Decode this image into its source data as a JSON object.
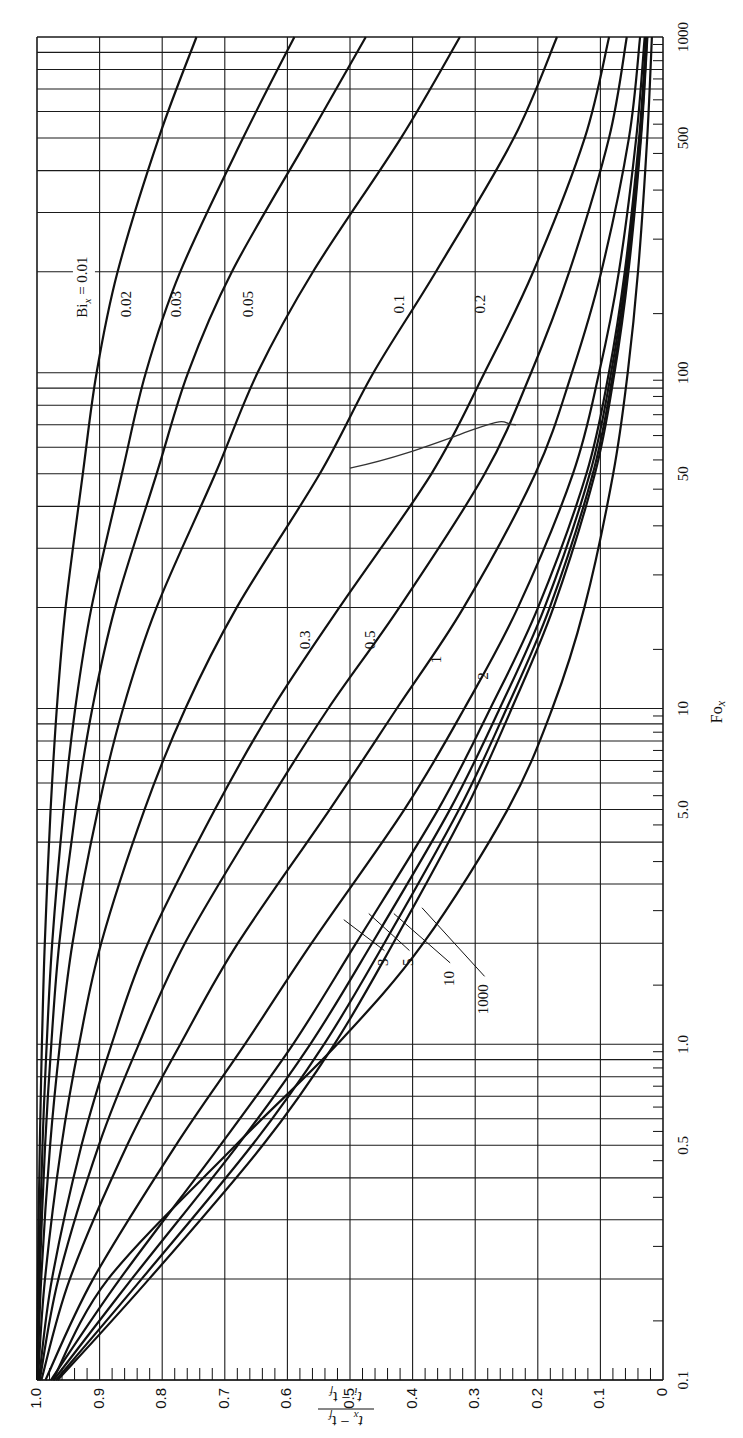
{
  "chart_data": {
    "type": "line",
    "title": "",
    "orientation_note": "figure rotated 90 degrees counter-clockwise",
    "xlabel": "Fo_x",
    "ylabel": "(t_x - t_f) / (t_i - t_f)",
    "x_scale": "log",
    "xlim": [
      0.1,
      1000
    ],
    "ylim": [
      0,
      1.0
    ],
    "grid": true,
    "x_tick_labels": [
      "0.1",
      "0.5",
      "1.0",
      "5.0",
      "10",
      "50",
      "100",
      "500",
      "1000"
    ],
    "y_tick_labels": [
      "0",
      "0.1",
      "0.2",
      "0.3",
      "0.4",
      "0.5",
      "0.6",
      "0.7",
      "0.8",
      "0.9",
      "1.0"
    ],
    "x": [
      0.1,
      0.2,
      0.5,
      1,
      2,
      5,
      10,
      20,
      50,
      100,
      200,
      500,
      1000
    ],
    "series": [
      {
        "name": "Bi_x = 0.01",
        "label": "Bi_x = 0.01",
        "values": [
          0.9999,
          0.9986,
          0.9955,
          0.9921,
          0.9876,
          0.9782,
          0.9683,
          0.9543,
          0.9268,
          0.9048,
          0.8712,
          0.8056,
          0.7452
        ]
      },
      {
        "name": "0.02",
        "label": "0.02",
        "values": [
          0.9997,
          0.9972,
          0.9912,
          0.9845,
          0.9757,
          0.9575,
          0.9389,
          0.9129,
          0.8643,
          0.8262,
          0.7711,
          0.6709,
          0.5888
        ]
      },
      {
        "name": "0.03",
        "label": "0.03",
        "values": [
          0.9995,
          0.9959,
          0.987,
          0.9772,
          0.9644,
          0.9381,
          0.9116,
          0.8752,
          0.8089,
          0.7588,
          0.6887,
          0.5667,
          0.4747
        ]
      },
      {
        "name": "0.05",
        "label": "0.05",
        "values": [
          0.9992,
          0.9933,
          0.979,
          0.9634,
          0.9433,
          0.9026,
          0.8625,
          0.809,
          0.7152,
          0.6477,
          0.5591,
          0.4187,
          0.3244
        ]
      },
      {
        "name": "0.1",
        "label": "0.1",
        "values": [
          0.9985,
          0.9873,
          0.9609,
          0.9327,
          0.8975,
          0.8282,
          0.763,
          0.6808,
          0.5482,
          0.4626,
          0.3628,
          0.2383,
          0.1694
        ]
      },
      {
        "name": "0.2",
        "label": "0.2",
        "values": [
          0.997,
          0.9761,
          0.9289,
          0.8808,
          0.8229,
          0.7158,
          0.624,
          0.5169,
          0.37,
          0.2851,
          0.2073,
          0.1251,
          0.0861
        ]
      },
      {
        "name": "0.3",
        "label": "0.3",
        "values": [
          0.9956,
          0.9658,
          0.9013,
          0.8374,
          0.7638,
          0.6371,
          0.5346,
          0.4211,
          0.2848,
          0.2107,
          0.1497,
          0.0863,
          0.0578
        ]
      },
      {
        "name": "0.5",
        "label": "0.5",
        "values": [
          0.9929,
          0.9474,
          0.856,
          0.7711,
          0.679,
          0.5324,
          0.4252,
          0.3184,
          0.204,
          0.1456,
          0.0986,
          0.0545,
          0.0366
        ]
      },
      {
        "name": "1",
        "label": "1",
        "values": [
          0.9865,
          0.9102,
          0.7782,
          0.668,
          0.5614,
          0.4132,
          0.3174,
          0.2317,
          0.1439,
          0.102,
          0.0704,
          0.0428,
          0.0293
        ]
      },
      {
        "name": "2",
        "label": "2",
        "values": [
          0.9776,
          0.8674,
          0.7073,
          0.5911,
          0.4903,
          0.3593,
          0.2758,
          0.1995,
          0.1223,
          0.0864,
          0.0611,
          0.0382,
          0.0268
        ]
      },
      {
        "name": "3",
        "label": "3",
        "values": [
          0.9734,
          0.8485,
          0.6794,
          0.5636,
          0.4647,
          0.3404,
          0.2608,
          0.1891,
          0.1169,
          0.0829,
          0.0588,
          0.037,
          0.0262
        ]
      },
      {
        "name": "5",
        "label": "5",
        "values": [
          0.9696,
          0.8327,
          0.6566,
          0.5415,
          0.4452,
          0.3259,
          0.2498,
          0.1809,
          0.1122,
          0.0797,
          0.0567,
          0.0359,
          0.0255
        ]
      },
      {
        "name": "10",
        "label": "10",
        "values": [
          0.9667,
          0.8207,
          0.6395,
          0.525,
          0.431,
          0.3154,
          0.2417,
          0.175,
          0.1088,
          0.0775,
          0.0552,
          0.0351,
          0.025
        ]
      },
      {
        "name": "1000",
        "label": "1000",
        "values": [
          0.9747,
          0.8862,
          0.6827,
          0.5205,
          0.3829,
          0.2482,
          0.1769,
          0.1255,
          0.0796,
          0.0564,
          0.0399,
          0.0252,
          0.0178
        ]
      }
    ],
    "label_positions": [
      {
        "text": "Bi_x = 0.01",
        "fo": 180,
        "theta": 0.925
      },
      {
        "text": "0.02",
        "fo": 160,
        "theta": 0.855
      },
      {
        "text": "0.03",
        "fo": 160,
        "theta": 0.775
      },
      {
        "text": "0.05",
        "fo": 160,
        "theta": 0.66
      },
      {
        "text": "0.1",
        "fo": 160,
        "theta": 0.42
      },
      {
        "text": "0.2",
        "fo": 160,
        "theta": 0.29
      },
      {
        "text": "0.3",
        "fo": 16,
        "theta": 0.57
      },
      {
        "text": "0.5",
        "fo": 16,
        "theta": 0.465
      },
      {
        "text": "1",
        "fo": 14,
        "theta": 0.36
      },
      {
        "text": "2",
        "fo": 12.5,
        "theta": 0.285
      }
    ],
    "leader_labels": [
      {
        "text": "3",
        "label_fo": 1.85,
        "label_theta": 0.445,
        "curve_fo": 2.35,
        "curve_theta": 0.51
      },
      {
        "text": "5",
        "label_fo": 1.85,
        "label_theta": 0.405,
        "curve_fo": 2.45,
        "curve_theta": 0.47
      },
      {
        "text": "10",
        "label_fo": 1.7,
        "label_theta": 0.34,
        "curve_fo": 2.45,
        "curve_theta": 0.43
      },
      {
        "text": "1000",
        "label_fo": 1.55,
        "label_theta": 0.285,
        "curve_fo": 2.55,
        "curve_theta": 0.385
      }
    ],
    "annotations": [
      "hand-drawn pencil mark crossing curves near Fo_x 50-70, values 0.25-0.5"
    ]
  },
  "axes": {
    "x_title_main": "Fo",
    "x_title_sub": "x",
    "y_title_num_a": "t",
    "y_title_num_sub": "x",
    "y_title_num_b": " − t",
    "y_title_num_sub2": "f",
    "y_title_den_a": "t",
    "y_title_den_sub": "i",
    "y_title_den_b": " − t",
    "y_title_den_sub2": "f"
  },
  "colors": {
    "ink": "#111111",
    "grid": "#1a1a1a",
    "background": "#ffffff"
  }
}
